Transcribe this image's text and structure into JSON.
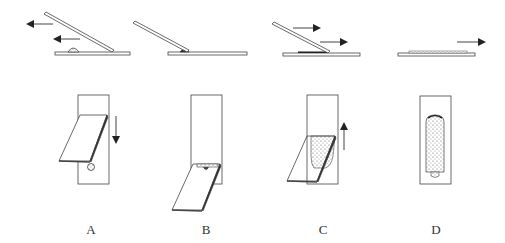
{
  "diagram": {
    "stroke_color": "#444444",
    "fill_color": "#ffffff",
    "smear_color": "#666666",
    "panels": [
      {
        "id": "A",
        "label": "A",
        "step": "spreader slide pulled back toward drop"
      },
      {
        "id": "B",
        "label": "B",
        "step": "drop spreads along spreader edge"
      },
      {
        "id": "C",
        "label": "C",
        "step": "spreader pushed forward forming smear"
      },
      {
        "id": "D",
        "label": "D",
        "step": "finished smear with feathered edge"
      }
    ]
  }
}
